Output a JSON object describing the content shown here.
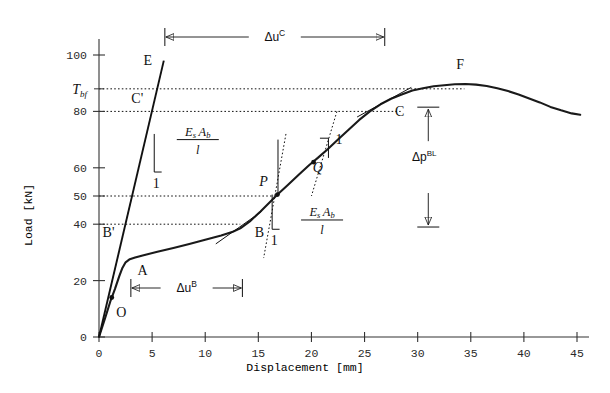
{
  "chart_data": {
    "type": "line",
    "title": "",
    "xlabel": "Displacement [mm]",
    "ylabel": "Load [kN]",
    "xlim": [
      0,
      46.5
    ],
    "ylim": [
      0,
      105
    ],
    "grid": false,
    "legend": "none",
    "x_ticks": [
      0,
      5,
      10,
      15,
      20,
      25,
      30,
      35,
      40,
      45
    ],
    "x_tick_labels": [
      "0",
      "5",
      "10",
      "15",
      "20",
      "25",
      "30",
      "35",
      "40",
      "45"
    ],
    "y_ticks": [
      0,
      20,
      40,
      50,
      60,
      80,
      100
    ],
    "y_tick_labels": [
      "0",
      "20",
      "40",
      "50",
      "60",
      "80",
      "100"
    ],
    "y_special_tick": {
      "value": 88,
      "label": "T",
      "sub": "bf"
    },
    "series": [
      {
        "name": "load-displacement-response",
        "points": [
          [
            0.0,
            0.0
          ],
          [
            0.6,
            7.0
          ],
          [
            1.1,
            13.0
          ],
          [
            1.5,
            17.0
          ],
          [
            1.9,
            21.5
          ],
          [
            2.2,
            24.5
          ],
          [
            2.5,
            26.5
          ],
          [
            2.9,
            27.6
          ],
          [
            3.4,
            28.2
          ],
          [
            4.2,
            29.0
          ],
          [
            5.5,
            30.2
          ],
          [
            7.0,
            31.6
          ],
          [
            8.5,
            33.0
          ],
          [
            10.0,
            34.5
          ],
          [
            11.5,
            36.0
          ],
          [
            12.6,
            37.3
          ],
          [
            13.3,
            38.5
          ],
          [
            14.2,
            41.0
          ],
          [
            15.2,
            44.5
          ],
          [
            16.0,
            47.5
          ],
          [
            16.8,
            50.5
          ],
          [
            17.8,
            54.0
          ],
          [
            18.8,
            57.5
          ],
          [
            19.8,
            61.0
          ],
          [
            20.6,
            63.5
          ],
          [
            21.5,
            66.5
          ],
          [
            22.5,
            70.0
          ],
          [
            23.5,
            73.5
          ],
          [
            24.5,
            77.0
          ],
          [
            25.5,
            80.0
          ],
          [
            26.5,
            82.5
          ],
          [
            27.5,
            84.5
          ],
          [
            28.5,
            86.0
          ],
          [
            29.5,
            87.4
          ],
          [
            30.5,
            88.2
          ],
          [
            31.5,
            88.9
          ],
          [
            32.5,
            89.3
          ],
          [
            33.5,
            89.6
          ],
          [
            34.5,
            89.7
          ],
          [
            35.5,
            89.5
          ],
          [
            36.5,
            89.0
          ],
          [
            37.5,
            88.2
          ],
          [
            38.5,
            87.2
          ],
          [
            39.5,
            86.0
          ],
          [
            40.5,
            84.6
          ],
          [
            41.5,
            83.2
          ],
          [
            42.5,
            81.6
          ],
          [
            43.5,
            80.4
          ],
          [
            44.5,
            79.3
          ],
          [
            45.3,
            78.8
          ]
        ]
      },
      {
        "name": "elastic-bar-line-OB-prime-C-prime-E",
        "points": [
          [
            0.0,
            0.0
          ],
          [
            6.1,
            98.0
          ]
        ]
      },
      {
        "name": "tangent-at-B",
        "points": [
          [
            11.0,
            33.0
          ],
          [
            15.3,
            44.5
          ]
        ]
      },
      {
        "name": "tangent-at-C",
        "points": [
          [
            24.3,
            78.0
          ],
          [
            29.4,
            88.5
          ]
        ]
      }
    ],
    "dotted_h_lines": [
      {
        "y": 88,
        "label": "T_bf",
        "x_from": 0,
        "x_to": 34.4
      },
      {
        "y": 80,
        "label": "80",
        "x_from": 0,
        "x_to": 28.4
      },
      {
        "y": 50,
        "label": "50",
        "x_from": 0,
        "x_to": 16.8
      },
      {
        "y": 40,
        "label": "40",
        "x_from": 0,
        "x_to": 13.3
      }
    ],
    "markers": [
      {
        "name": "O",
        "label": "O",
        "x": 1.2,
        "y": 14.0,
        "lx": 2.1,
        "ly": 7.0
      },
      {
        "name": "A",
        "label": "A",
        "x": 3.0,
        "y": 27.8,
        "lx": 4.1,
        "ly": 22.0
      },
      {
        "name": "B",
        "label": "B",
        "x": 13.3,
        "y": 38.5,
        "lx": 15.1,
        "ly": 35.5
      },
      {
        "name": "Bp",
        "label": "B'",
        "x": 2.5,
        "y": 40.0,
        "lx": 0.9,
        "ly": 35.5
      },
      {
        "name": "P",
        "label": "P",
        "x": 16.8,
        "y": 50.5,
        "lx": 15.5,
        "ly": 53.5
      },
      {
        "name": "Q",
        "label": "Q",
        "x": 20.2,
        "y": 62.0,
        "lx": 20.6,
        "ly": 58.5
      },
      {
        "name": "C",
        "label": "C",
        "x": 26.5,
        "y": 82.5,
        "lx": 28.3,
        "ly": 78.5
      },
      {
        "name": "Cp",
        "label": "C'",
        "x": 5.0,
        "y": 80.0,
        "lx": 3.6,
        "ly": 83.0
      },
      {
        "name": "E",
        "label": "E",
        "x": 5.8,
        "y": 94.0,
        "lx": 4.6,
        "ly": 96.5
      },
      {
        "name": "F",
        "label": "F",
        "x": 33.6,
        "y": 89.6,
        "lx": 34.0,
        "ly": 95.0
      }
    ],
    "annotations": {
      "delta_u_C": {
        "base": "Δu",
        "sup": "C",
        "x_from": 6.2,
        "x_to": 26.9,
        "y_px": 37
      },
      "delta_u_B": {
        "base": "Δu",
        "sup": "B",
        "x_from": 3.0,
        "x_to": 13.5,
        "y_px": 288
      },
      "delta_p_BL": {
        "base": "Δp",
        "sup": "BL",
        "x": 31.0,
        "y_top": 81.5,
        "y_bottom": 39.0
      },
      "slope_label_upper": {
        "num_1": "E",
        "num_1_sub": "s",
        "num_2": "A",
        "num_2_sub": "b",
        "den": "l",
        "unit": "1"
      },
      "slope_label_lower": {
        "num_1": "E",
        "num_1_sub": "s",
        "num_2": "A",
        "num_2_sub": "b",
        "den": "l",
        "unit": "1"
      },
      "slope_unit_Q": "1"
    }
  },
  "figure": {
    "name": "bond-slip-load-displacement-diagram"
  }
}
